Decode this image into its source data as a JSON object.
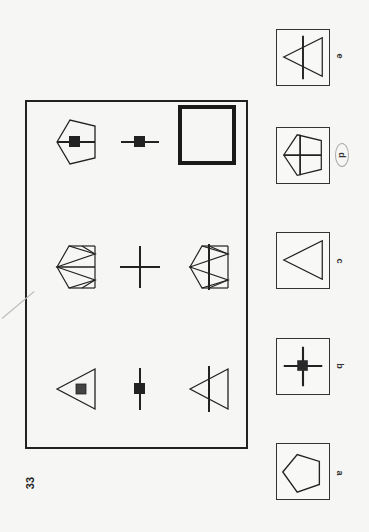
{
  "question": {
    "number": "33",
    "orientation": "rotated 90deg counter-clockwise",
    "grid": {
      "rows": [
        {
          "cells": [
            {
              "figure": "pentagon with horizontal line and black square"
            },
            {
              "figure": "horizontal line with black square"
            },
            {
              "figure": "thick square outline"
            }
          ]
        },
        {
          "cells": [
            {
              "figure": "pentagon with fan lines and bow-tie"
            },
            {
              "figure": "cross"
            },
            {
              "figure": "pentagon fan with vertical line and bow-tie"
            }
          ]
        },
        {
          "cells": [
            {
              "figure": "triangle with grey square"
            },
            {
              "figure": "vertical line with black square"
            },
            {
              "figure": "triangle with vertical line"
            }
          ]
        }
      ]
    },
    "options": [
      {
        "label": "a",
        "figure": "pentagon"
      },
      {
        "label": "b",
        "figure": "cross with black square"
      },
      {
        "label": "c",
        "figure": "triangle"
      },
      {
        "label": "d",
        "figure": "pentagon with cross",
        "circled": true
      },
      {
        "label": "e",
        "figure": "triangle with vertical line"
      }
    ]
  },
  "colors": {
    "ink": "#222222",
    "paper": "#f6f6f4",
    "pencil_circle": "#aaaaaa"
  }
}
